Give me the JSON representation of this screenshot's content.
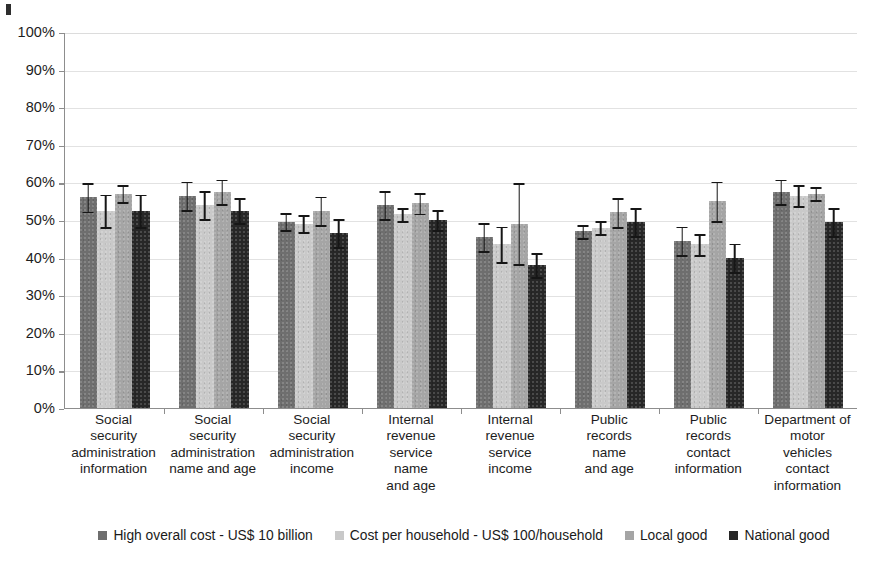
{
  "chart_data": {
    "type": "bar",
    "title": "",
    "subtitle": "",
    "xlabel": "",
    "ylabel": "",
    "ylim": [
      0,
      100
    ],
    "ytick_labels": [
      "100%",
      "90%",
      "80%",
      "70%",
      "60%",
      "50%",
      "40%",
      "30%",
      "20%",
      "10%",
      "0%"
    ],
    "ytick_values": [
      100,
      90,
      80,
      70,
      60,
      50,
      40,
      30,
      20,
      10,
      0
    ],
    "ytick_step": 10,
    "value_unit": "%",
    "grid": "horizontal",
    "legend_position": "bottom",
    "orientation": "vertical",
    "error_bars": "symmetric",
    "categories": [
      "Social security administration information",
      "Social security administration name and age",
      "Social security administration income",
      "Internal revenue service name and age",
      "Internal revenue service income",
      "Public records name and age",
      "Public records contact information",
      "Department of motor vehicles contact information"
    ],
    "category_lines": [
      [
        "Social",
        "security",
        "administration",
        "information"
      ],
      [
        "Social",
        "security",
        "administration",
        "name and age"
      ],
      [
        "Social",
        "security",
        "administration",
        "income"
      ],
      [
        "Internal",
        "revenue",
        "service",
        "name",
        "and age"
      ],
      [
        "Internal",
        "revenue",
        "service",
        "income"
      ],
      [
        "Public",
        "records",
        "name",
        "and age"
      ],
      [
        "Public",
        "records",
        "contact",
        "information"
      ],
      [
        "Department of",
        "motor",
        "vehicles",
        "contact",
        "information"
      ]
    ],
    "series": [
      {
        "name": "High overall cost - US$ 10 billion",
        "color": "#6e6e6e",
        "values": [
          56.0,
          56.5,
          49.5,
          54.0,
          45.5,
          47.0,
          44.5,
          57.5
        ],
        "errors": [
          4.0,
          4.0,
          2.5,
          4.0,
          4.0,
          2.0,
          4.0,
          3.5
        ]
      },
      {
        "name": "Cost per household - US$ 100/household",
        "color": "#c9c9c9",
        "values": [
          52.5,
          54.0,
          49.0,
          51.5,
          43.5,
          48.0,
          43.5,
          56.5
        ],
        "errors": [
          4.5,
          4.0,
          2.5,
          2.0,
          5.0,
          2.0,
          3.0,
          3.0
        ]
      },
      {
        "name": "Local good",
        "color": "#a5a5a5",
        "values": [
          57.0,
          57.5,
          52.5,
          54.5,
          49.0,
          52.0,
          55.0,
          57.0
        ],
        "errors": [
          2.5,
          3.5,
          4.0,
          3.0,
          11.0,
          4.0,
          5.5,
          2.0
        ]
      },
      {
        "name": "National good",
        "color": "#272727",
        "values": [
          52.5,
          52.5,
          46.5,
          50.0,
          38.0,
          49.5,
          40.0,
          49.5
        ],
        "errors": [
          4.5,
          3.5,
          4.0,
          3.0,
          3.5,
          4.0,
          4.0,
          4.0
        ]
      }
    ]
  },
  "legend": {
    "items": [
      {
        "label": "High overall cost - US$ 10 billion",
        "color": "#6e6e6e"
      },
      {
        "label": "Cost per household - US$ 100/household",
        "color": "#c9c9c9"
      },
      {
        "label": "Local good",
        "color": "#a5a5a5"
      },
      {
        "label": "National good",
        "color": "#272727"
      }
    ]
  }
}
